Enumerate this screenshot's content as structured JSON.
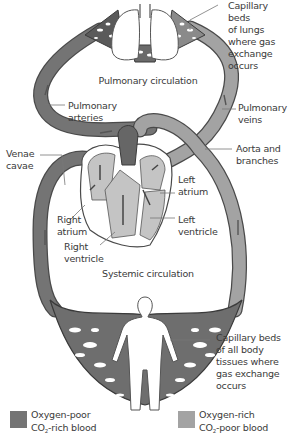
{
  "diagram": {
    "title_regions": {
      "pulmonary": "Pulmonary circulation",
      "systemic": "Systemic circulation"
    },
    "labels": {
      "capillary_lungs": "Capillary beds\nof lungs\nwhere gas\nexchange\noccurs",
      "pulmonary_arteries": "Pulmonary\narteries",
      "pulmonary_veins": "Pulmonary\nveins",
      "venae_cavae": "Venae\ncavae",
      "aorta": "Aorta and\nbranches",
      "left_atrium": "Left\natrium",
      "left_ventricle": "Left\nventricle",
      "right_atrium": "Right\natrium",
      "right_ventricle": "Right\nventricle",
      "capillary_body": "Capillary beds\nof all body\ntissues where\ngas exchange\noccurs"
    },
    "colors": {
      "oxygen_poor": "#747474",
      "oxygen_rich": "#a3a3a3",
      "heart_fill": "#c4c4c4",
      "outline": "#4a4a4a"
    }
  },
  "legend": {
    "items": [
      {
        "line1": "Oxygen-poor",
        "line2_prefix": "CO",
        "line2_sub": "2",
        "line2_suffix": "-rich blood",
        "color": "#747474"
      },
      {
        "line1": "Oxygen-rich",
        "line2_prefix": "CO",
        "line2_sub": "2",
        "line2_suffix": "-poor blood",
        "color": "#a3a3a3"
      }
    ]
  }
}
